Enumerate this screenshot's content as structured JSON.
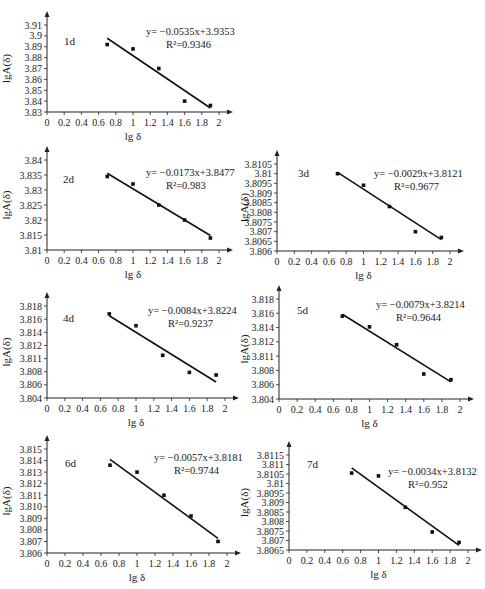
{
  "figure": {
    "x_label": "lg δ",
    "y_label": "lgA(δ)"
  },
  "chart_data": [
    {
      "type": "scatter",
      "panel_label": "1d",
      "title": "1d",
      "xlabel": "lg δ",
      "ylabel": "lgA(δ)",
      "x_ticks": [
        "0",
        "0.2",
        "0.4",
        "0.6",
        "0.8",
        "1",
        "1.2",
        "1.4",
        "1.6",
        "1.8",
        "2"
      ],
      "y_ticks": [
        "3.83",
        "3.84",
        "3.85",
        "3.86",
        "3.87",
        "3.88",
        "3.89",
        "3.9",
        "3.91"
      ],
      "xlim": [
        0,
        2
      ],
      "ylim": [
        3.83,
        3.91
      ],
      "x": [
        0.7,
        1.0,
        1.3,
        1.6,
        1.9
      ],
      "y": [
        3.892,
        3.888,
        3.87,
        3.84,
        3.836
      ],
      "trendline": {
        "slope": -0.0535,
        "intercept": 3.9353,
        "x_range": [
          0.7,
          1.9
        ]
      },
      "equation": "y= −0.0535x+3.9353",
      "r2": "R²=0.9346",
      "grid": false
    },
    {
      "type": "scatter",
      "panel_label": "2d",
      "title": "2d",
      "xlabel": "lg δ",
      "ylabel": "lgA(δ)",
      "x_ticks": [
        "0",
        "0.2",
        "0.4",
        "0.6",
        "0.8",
        "1",
        "1.2",
        "1.4",
        "1.6",
        "1.8",
        "2"
      ],
      "y_ticks": [
        "3.81",
        "3.815",
        "3.82",
        "3.825",
        "3.83",
        "3.835",
        "3.84"
      ],
      "xlim": [
        0,
        2
      ],
      "ylim": [
        3.81,
        3.84
      ],
      "x": [
        0.7,
        1.0,
        1.3,
        1.6,
        1.9
      ],
      "y": [
        3.8345,
        3.832,
        3.825,
        3.82,
        3.814
      ],
      "trendline": {
        "slope": -0.0173,
        "intercept": 3.8477,
        "x_range": [
          0.7,
          1.9
        ]
      },
      "equation": "y= −0.0173x+3.8477",
      "r2": "R²=0.983",
      "grid": false
    },
    {
      "type": "scatter",
      "panel_label": "3d",
      "title": "3d",
      "xlabel": "lg δ",
      "ylabel": "lgA(δ)",
      "x_ticks": [
        "0",
        "0.2",
        "0.4",
        "0.6",
        "0.8",
        "1",
        "1.2",
        "1.4",
        "1.6",
        "1.8",
        "2"
      ],
      "y_ticks": [
        "3.806",
        "3.8065",
        "3.807",
        "3.8075",
        "3.808",
        "3.8085",
        "3.809",
        "3.8095",
        "3.81",
        "3.8105"
      ],
      "xlim": [
        0,
        2
      ],
      "ylim": [
        3.806,
        3.8105
      ],
      "x": [
        0.7,
        1.0,
        1.3,
        1.6,
        1.9
      ],
      "y": [
        3.81,
        3.8094,
        3.8083,
        3.807,
        3.8067
      ],
      "trendline": {
        "slope": -0.0029,
        "intercept": 3.8121,
        "x_range": [
          0.7,
          1.9
        ]
      },
      "equation": "y= −0.0029x+3.8121",
      "r2": "R²=0.9677",
      "grid": false
    },
    {
      "type": "scatter",
      "panel_label": "4d",
      "title": "4d",
      "xlabel": "lg δ",
      "ylabel": "lgA(δ)",
      "x_ticks": [
        "0",
        "0.2",
        "0.4",
        "0.6",
        "0.8",
        "1",
        "1.2",
        "1.4",
        "1.6",
        "1.8",
        "2"
      ],
      "y_ticks": [
        "3.804",
        "3.806",
        "3.808",
        "3.811",
        "3.812",
        "3.814",
        "3.816",
        "3.818"
      ],
      "xlim": [
        0,
        2
      ],
      "ylim": [
        3.804,
        3.818
      ],
      "x": [
        0.7,
        1.0,
        1.3,
        1.6,
        1.9
      ],
      "y": [
        3.8168,
        3.815,
        3.8105,
        3.8079,
        3.8075
      ],
      "trendline": {
        "slope": -0.0084,
        "intercept": 3.8224,
        "x_range": [
          0.7,
          1.9
        ]
      },
      "equation": "y= −0.0084x+3.8224",
      "r2": "R²=0.9237",
      "grid": false
    },
    {
      "type": "scatter",
      "panel_label": "5d",
      "title": "5d",
      "xlabel": "lg δ",
      "ylabel": "lgA(δ)",
      "x_ticks": [
        "0",
        "0.2",
        "0.4",
        "0.6",
        "0.8",
        "1",
        "1.2",
        "1.4",
        "1.6",
        "1.8",
        "2"
      ],
      "y_ticks": [
        "3.804",
        "3.806",
        "3.808",
        "3.811",
        "3.812",
        "3.814",
        "3.816",
        "3.818"
      ],
      "xlim": [
        0,
        2
      ],
      "ylim": [
        3.804,
        3.818
      ],
      "x": [
        0.7,
        1.0,
        1.3,
        1.6,
        1.9
      ],
      "y": [
        3.8156,
        3.8141,
        3.8116,
        3.8075,
        3.8067
      ],
      "trendline": {
        "slope": -0.0079,
        "intercept": 3.8214,
        "x_range": [
          0.7,
          1.9
        ]
      },
      "equation": "y= −0.0079x+3.8214",
      "r2": "R²=0.9644",
      "grid": false
    },
    {
      "type": "scatter",
      "panel_label": "6d",
      "title": "6d",
      "xlabel": "lg δ",
      "ylabel": "lgA(δ)",
      "x_ticks": [
        "0",
        "0.2",
        "0.4",
        "0.6",
        "0.8",
        "1",
        "1.2",
        "1.4",
        "1.6",
        "1.8",
        "2"
      ],
      "y_ticks": [
        "3.806",
        "3.807",
        "3.808",
        "3.809",
        "3.810",
        "3.811",
        "3.812",
        "3.813",
        "3.814",
        "3.815"
      ],
      "xlim": [
        0,
        2
      ],
      "ylim": [
        3.806,
        3.815
      ],
      "x": [
        0.7,
        1.0,
        1.3,
        1.6,
        1.9
      ],
      "y": [
        3.8136,
        3.813,
        3.811,
        3.8092,
        3.807
      ],
      "trendline": {
        "slope": -0.0057,
        "intercept": 3.8181,
        "x_range": [
          0.7,
          1.9
        ]
      },
      "equation": "y= −0.0057x+3.8181",
      "r2": "R²=0.9744",
      "grid": false
    },
    {
      "type": "scatter",
      "panel_label": "7d",
      "title": "7d",
      "xlabel": "lg δ",
      "ylabel": "lgA(δ)",
      "x_ticks": [
        "0",
        "0.2",
        "0.4",
        "0.6",
        "0.8",
        "1",
        "1.2",
        "1.4",
        "1.6",
        "1.8",
        "2"
      ],
      "y_ticks": [
        "3.8065",
        "3.807",
        "3.8075",
        "3.808",
        "3.8085",
        "3.809",
        "3.8095",
        "3.81",
        "3.8105",
        "3.811",
        "3.8115"
      ],
      "xlim": [
        0,
        2
      ],
      "ylim": [
        3.8065,
        3.8115
      ],
      "x": [
        0.7,
        1.0,
        1.3,
        1.6,
        1.9
      ],
      "y": [
        3.81055,
        3.8104,
        3.80875,
        3.80745,
        3.8069
      ],
      "trendline": {
        "slope": -0.0034,
        "intercept": 3.8132,
        "x_range": [
          0.7,
          1.9
        ]
      },
      "equation": "y= −0.0034x+3.8132",
      "r2": "R²=0.952",
      "grid": false
    }
  ],
  "layout": [
    {
      "left": 0,
      "top": 0,
      "w": 240,
      "h": 148,
      "plot": {
        "x0": 47,
        "x1": 219,
        "y0": 112,
        "y1": 25
      },
      "eq_at": [
        146,
        35
      ],
      "label_at": [
        64,
        45
      ]
    },
    {
      "left": 0,
      "top": 150,
      "w": 240,
      "h": 138,
      "plot": {
        "x0": 47,
        "x1": 219,
        "y0": 100,
        "y1": 10
      },
      "eq_at": [
        146,
        26
      ],
      "label_at": [
        63,
        33
      ]
    },
    {
      "left": 238,
      "top": 150,
      "w": 247,
      "h": 138,
      "plot": {
        "x0": 39,
        "x1": 212,
        "y0": 101,
        "y1": 14
      },
      "eq_at": [
        136,
        27
      ],
      "label_at": [
        60,
        27
      ]
    },
    {
      "left": 0,
      "top": 287,
      "w": 240,
      "h": 148,
      "plot": {
        "x0": 47,
        "x1": 225,
        "y0": 111,
        "y1": 19
      },
      "eq_at": [
        148,
        27
      ],
      "label_at": [
        63,
        35
      ]
    },
    {
      "left": 238,
      "top": 287,
      "w": 247,
      "h": 148,
      "plot": {
        "x0": 41,
        "x1": 222,
        "y0": 112,
        "y1": 12
      },
      "eq_at": [
        138,
        21
      ],
      "label_at": [
        59,
        27
      ]
    },
    {
      "left": 0,
      "top": 437,
      "w": 240,
      "h": 152,
      "plot": {
        "x0": 47,
        "x1": 227,
        "y0": 116,
        "y1": 12
      },
      "eq_at": [
        154,
        24
      ],
      "label_at": [
        65,
        30
      ]
    },
    {
      "left": 238,
      "top": 437,
      "w": 247,
      "h": 152,
      "plot": {
        "x0": 51,
        "x1": 230,
        "y0": 113,
        "y1": 18
      },
      "eq_at": [
        150,
        38
      ],
      "label_at": [
        69,
        31
      ]
    }
  ]
}
